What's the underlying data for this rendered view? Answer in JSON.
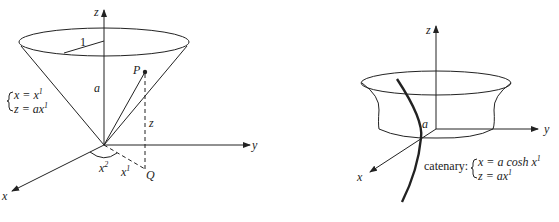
{
  "figures": [
    {
      "id": "cone",
      "description": "Cone with parametrization",
      "labels": {
        "z_axis": "z",
        "y_axis": "y",
        "x_axis": "x",
        "radius": "1",
        "height": "a",
        "point_p": "P",
        "point_q": "Q",
        "z_coord": "z",
        "angle": "x",
        "angle_sup": "2",
        "radial": "x",
        "radial_sup": "1"
      },
      "equations": {
        "line1_lhs": "x = x",
        "line1_sup": "1",
        "line2_lhs": "z = ax",
        "line2_sup": "1"
      }
    },
    {
      "id": "catenoid",
      "description": "Catenoid generated by rotating a catenary",
      "labels": {
        "z_axis": "z",
        "y_axis": "y",
        "x_axis": "x",
        "height": "a"
      },
      "equations": {
        "prefix": "catenary:",
        "line1_lhs": "x = a cosh x",
        "line1_sup": "1",
        "line2_lhs": "z = ax",
        "line2_sup": "1"
      }
    }
  ]
}
